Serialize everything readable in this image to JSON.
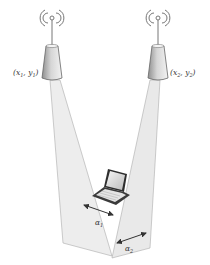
{
  "diagram": {
    "access_points": [
      {
        "id": "ap1",
        "label": {
          "open": "(",
          "x": "x",
          "x_sub": "1",
          "sep": ", ",
          "y": "y",
          "y_sub": "1",
          "close": ")"
        }
      },
      {
        "id": "ap2",
        "label": {
          "open": "(",
          "x": "x",
          "x_sub": "2",
          "sep": ", ",
          "y": "y",
          "y_sub": "2",
          "close": ")"
        }
      }
    ],
    "beam_width_labels": [
      {
        "symbol": "α",
        "sub": "1"
      },
      {
        "symbol": "α",
        "sub": "2"
      }
    ],
    "device": "laptop",
    "colors": {
      "beam_fill": "#e9e9e9",
      "beam_stroke": "#9a9a9a",
      "tower_light": "#e6e6e6",
      "tower_dark": "#8a8a8a",
      "arrow": "#333333",
      "text": "#333333"
    }
  }
}
